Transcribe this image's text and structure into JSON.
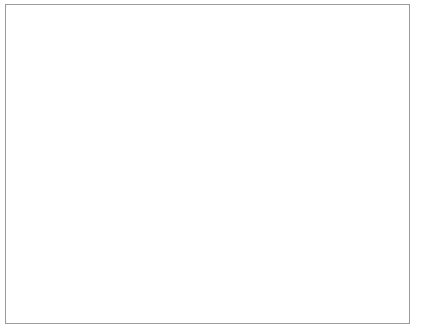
{
  "chart_data": {
    "type": "bar",
    "style": "3d-column",
    "title": "",
    "xlabel": "",
    "ylabel": "",
    "categories": [
      "Yes, definitely",
      "Yes, possibly",
      "I don't know",
      "No, probably not",
      "No, definitely not"
    ],
    "category_lines": [
      [
        "Yes,",
        "definitely"
      ],
      [
        "Yes,",
        "possibly"
      ],
      [
        "I don't know",
        ""
      ],
      [
        "No, probably",
        "not"
      ],
      [
        "No, definitely",
        "not"
      ]
    ],
    "values": [
      8,
      3,
      1,
      0,
      0
    ],
    "ylim": [
      0,
      12
    ],
    "ytick_labels": [
      "0",
      "2",
      "4",
      "6",
      "8",
      "10",
      "12"
    ],
    "ytick_values": [
      0,
      2,
      4,
      6,
      8,
      10,
      12
    ],
    "grid": true,
    "legend": false,
    "colors": {
      "bar_front": "#dcdcdc",
      "bar_side": "#c0c0c0",
      "bar_top": "#e8e8e8",
      "outline": "#555555",
      "gridline": "#6e6e6e",
      "axis": "#3a3a3a",
      "floor": "#ffffff",
      "wall": "#ffffff",
      "frame": "#9a9a9a",
      "background": "#ffffff",
      "text": "#1a1a1a"
    },
    "label_rotation_deg": -45
  }
}
